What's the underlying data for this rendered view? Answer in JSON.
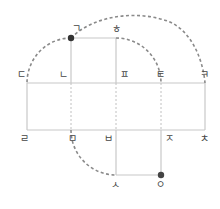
{
  "diagram": {
    "colors": {
      "solid_line": "#c8c8c8",
      "dotted_line": "#c8c8c8",
      "dashed_arc": "#8a8a8a",
      "dot": "#333333",
      "label": "#444444"
    },
    "nodes": [
      {
        "id": "giyeok",
        "label": "ㄱ",
        "x": 71,
        "y": 38,
        "marked": true
      },
      {
        "id": "hieut",
        "label": "ㅎ",
        "x": 116,
        "y": 38,
        "marked": false
      },
      {
        "id": "digeut",
        "label": "ㄷ",
        "x": 27,
        "y": 83,
        "marked": false
      },
      {
        "id": "nieun",
        "label": "ㄴ",
        "x": 71,
        "y": 83,
        "marked": false
      },
      {
        "id": "pieup",
        "label": "ㅍ",
        "x": 116,
        "y": 83,
        "marked": false
      },
      {
        "id": "tieut",
        "label": "ㅌ",
        "x": 161,
        "y": 83,
        "marked": false
      },
      {
        "id": "kieuk",
        "label": "ㅋ",
        "x": 205,
        "y": 83,
        "marked": false
      },
      {
        "id": "rieul",
        "label": "ㄹ",
        "x": 27,
        "y": 130,
        "marked": false
      },
      {
        "id": "mieum",
        "label": "ㅁ",
        "x": 71,
        "y": 130,
        "marked": false
      },
      {
        "id": "bieup",
        "label": "ㅂ",
        "x": 116,
        "y": 130,
        "marked": false
      },
      {
        "id": "jieut",
        "label": "ㅈ",
        "x": 161,
        "y": 130,
        "marked": false
      },
      {
        "id": "chieut",
        "label": "ㅊ",
        "x": 205,
        "y": 130,
        "marked": false
      },
      {
        "id": "siot",
        "label": "ㅅ",
        "x": 116,
        "y": 175,
        "marked": false
      },
      {
        "id": "ieung",
        "label": "ㅇ",
        "x": 161,
        "y": 175,
        "marked": true
      }
    ],
    "labels": {
      "giyeok": "ㄱ",
      "hieut": "ㅎ",
      "digeut": "ㄷ",
      "nieun": "ㄴ",
      "pieup": "ㅍ",
      "tieut": "ㅌ",
      "kieuk": "ㅋ",
      "rieul": "ㄹ",
      "mieum": "ㅁ",
      "bieup": "ㅂ",
      "jieut": "ㅈ",
      "chieut": "ㅊ",
      "siot": "ㅅ",
      "ieung": "ㅇ"
    },
    "edges": [
      {
        "from": "giyeok",
        "to": "hieut",
        "style": "solid"
      },
      {
        "from": "giyeok",
        "to": "nieun",
        "style": "solid"
      },
      {
        "from": "hieut",
        "to": "pieup",
        "style": "solid"
      },
      {
        "from": "digeut",
        "to": "kieuk",
        "style": "solid"
      },
      {
        "from": "rieul",
        "to": "chieut",
        "style": "solid"
      },
      {
        "from": "digeut",
        "to": "rieul",
        "style": "solid"
      },
      {
        "from": "kieuk",
        "to": "chieut",
        "style": "solid"
      },
      {
        "from": "nieun",
        "to": "mieum",
        "style": "dotted"
      },
      {
        "from": "pieup",
        "to": "bieup",
        "style": "dotted"
      },
      {
        "from": "tieut",
        "to": "jieut",
        "style": "dotted"
      },
      {
        "from": "bieup",
        "to": "siot",
        "style": "solid"
      },
      {
        "from": "jieut",
        "to": "ieung",
        "style": "solid"
      },
      {
        "from": "siot",
        "to": "ieung",
        "style": "solid"
      }
    ],
    "arcs": [
      {
        "from": "giyeok",
        "to": "digeut",
        "style": "dashed"
      },
      {
        "from": "giyeok",
        "to": "kieuk",
        "style": "dashed"
      },
      {
        "from": "hieut",
        "to": "tieut",
        "style": "dashed"
      },
      {
        "from": "mieum",
        "to": "siot",
        "style": "dashed"
      }
    ]
  }
}
